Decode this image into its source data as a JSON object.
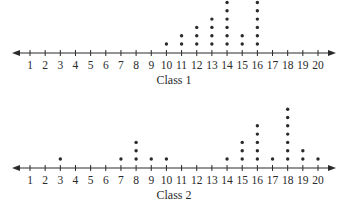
{
  "chart_data": [
    {
      "type": "dot",
      "title": "Class 1",
      "xlabel": "Class 1",
      "ylabel": "",
      "x": [
        1,
        2,
        3,
        4,
        5,
        6,
        7,
        8,
        9,
        10,
        11,
        12,
        13,
        14,
        15,
        16,
        17,
        18,
        19,
        20
      ],
      "counts": [
        0,
        0,
        0,
        0,
        0,
        0,
        0,
        0,
        0,
        1,
        2,
        3,
        4,
        6,
        2,
        6,
        0,
        0,
        0,
        0
      ],
      "xlim": [
        1,
        20
      ],
      "grid": false
    },
    {
      "type": "dot",
      "title": "Class 2",
      "xlabel": "Class 2",
      "ylabel": "",
      "x": [
        1,
        2,
        3,
        4,
        5,
        6,
        7,
        8,
        9,
        10,
        11,
        12,
        13,
        14,
        15,
        16,
        17,
        18,
        19,
        20
      ],
      "counts": [
        0,
        0,
        1,
        0,
        0,
        0,
        1,
        3,
        1,
        1,
        0,
        0,
        0,
        1,
        3,
        5,
        1,
        7,
        2,
        1
      ],
      "xlim": [
        1,
        20
      ],
      "grid": false
    }
  ],
  "plots": [
    {
      "title": "Class 1"
    },
    {
      "title": "Class 2"
    }
  ]
}
